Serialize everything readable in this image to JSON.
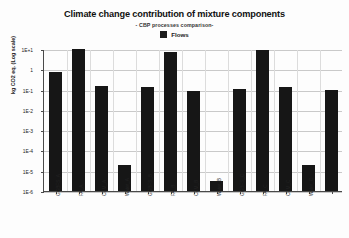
{
  "chart_data": {
    "type": "bar",
    "title": "Climate change contribution of mixture components",
    "subtitle": "- CBP processes comparison-",
    "xlabel": "",
    "ylabel": "kg CO2 eq. (Log scale)",
    "log_scale": true,
    "ylim": [
      1e-06,
      10
    ],
    "grid": true,
    "legend_position": "top-center",
    "legend": [
      "Flows"
    ],
    "series": [
      {
        "name": "Flows",
        "color": "#161616",
        "values": [
          0.7,
          10,
          0.15,
          2e-05,
          0.13,
          7,
          0.09,
          3e-06,
          0.11,
          9,
          0.13,
          2e-05,
          0.1
        ]
      }
    ],
    "categories": [
      "GGBFS_A",
      "FA_A",
      "CEM_A",
      "Water_A",
      "GGBFS_B",
      "FA_B",
      "CEM_B",
      "Water_B",
      "GGBFS_C",
      "FA_C",
      "CEM_C",
      "Water_C",
      ""
    ],
    "ytick_labels": [
      "1E+1",
      "1",
      "1E-1",
      "1E-2",
      "1E-3",
      "1E-4",
      "1E-5",
      "1E-6"
    ],
    "ytick_values": [
      10,
      1,
      0.1,
      0.01,
      0.001,
      0.0001,
      1e-05,
      1e-06
    ]
  }
}
